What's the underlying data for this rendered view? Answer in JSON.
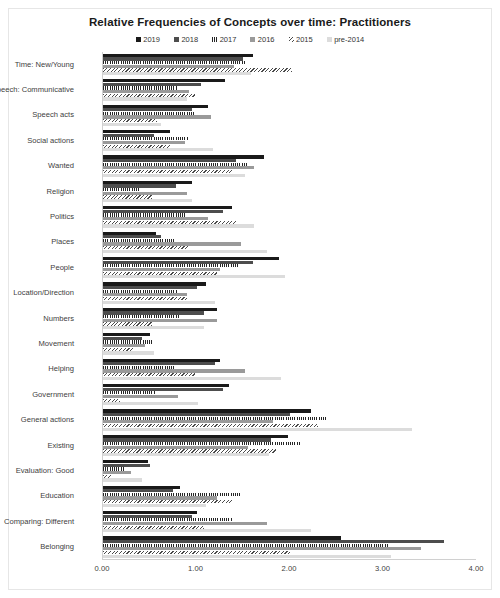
{
  "chart_data": {
    "type": "bar",
    "orientation": "horizontal",
    "title": "Relative Frequencies of Concepts over time: Practitioners",
    "xlabel": "",
    "ylabel": "",
    "xlim": [
      0,
      4
    ],
    "xticks": [
      "0.00",
      "1.00",
      "2.00",
      "3.00",
      "4.00"
    ],
    "xtick_values": [
      0,
      1,
      2,
      3,
      4
    ],
    "grid": false,
    "legend_position": "top-center",
    "categories": [
      "Time: New/Young",
      "Speech: Communicative",
      "Speech acts",
      "Social actions",
      "Wanted",
      "Religion",
      "Politics",
      "Places",
      "People",
      "Location/Direction",
      "Numbers",
      "Movement",
      "Helping",
      "Government",
      "General actions",
      "Existing",
      "Evaluation: Good",
      "Education",
      "Comparing: Different",
      "Belonging"
    ],
    "series": [
      {
        "name": "2019",
        "color": "#1a1a1a",
        "pattern": "solid",
        "values": [
          1.6,
          1.3,
          1.12,
          0.72,
          1.72,
          0.95,
          1.38,
          0.57,
          1.88,
          1.1,
          1.22,
          0.5,
          1.25,
          1.35,
          2.22,
          1.98,
          0.48,
          0.82,
          1.0,
          2.55
        ]
      },
      {
        "name": "2018",
        "color": "#4d4d4d",
        "pattern": "solid-gray",
        "values": [
          1.5,
          1.05,
          0.95,
          0.55,
          1.42,
          0.78,
          1.28,
          0.62,
          1.6,
          1.0,
          1.08,
          0.42,
          1.2,
          1.28,
          2.0,
          1.8,
          0.5,
          0.75,
          0.95,
          3.65
        ]
      },
      {
        "name": "2017",
        "color": "#262626",
        "pattern": "vertical-hatch",
        "values": [
          1.52,
          0.8,
          0.98,
          0.92,
          1.55,
          0.38,
          0.88,
          0.78,
          1.45,
          0.8,
          0.82,
          0.52,
          0.78,
          0.56,
          2.4,
          2.12,
          0.22,
          1.48,
          1.38,
          3.05
        ]
      },
      {
        "name": "2016",
        "color": "#9a9a9a",
        "pattern": "solid-light",
        "values": [
          1.4,
          0.92,
          1.15,
          0.88,
          1.62,
          0.9,
          1.12,
          1.48,
          1.25,
          0.9,
          1.22,
          0.45,
          1.52,
          0.8,
          1.82,
          1.55,
          0.3,
          1.22,
          1.75,
          3.4
        ]
      },
      {
        "name": "2015",
        "color": "#4a4a4a",
        "pattern": "diagonal-hatch",
        "values": [
          2.02,
          0.98,
          0.58,
          0.72,
          1.38,
          0.52,
          1.42,
          0.92,
          1.22,
          0.9,
          0.52,
          0.32,
          0.98,
          0.18,
          2.3,
          1.85,
          0.1,
          1.38,
          1.08,
          2.0
        ]
      },
      {
        "name": "pre-2014",
        "color": "#dcdcdc",
        "pattern": "solid-pale",
        "values": [
          1.58,
          0.9,
          0.62,
          1.18,
          1.52,
          0.95,
          1.62,
          1.75,
          1.95,
          1.2,
          1.08,
          0.55,
          1.9,
          1.02,
          3.3,
          1.78,
          0.42,
          1.1,
          2.22,
          3.08
        ]
      }
    ]
  },
  "colors": {
    "background": "#ffffff",
    "frame": "#e6e6e6",
    "axis": "#d0d0d0",
    "text": "#404040",
    "title": "#1a1a1a"
  }
}
